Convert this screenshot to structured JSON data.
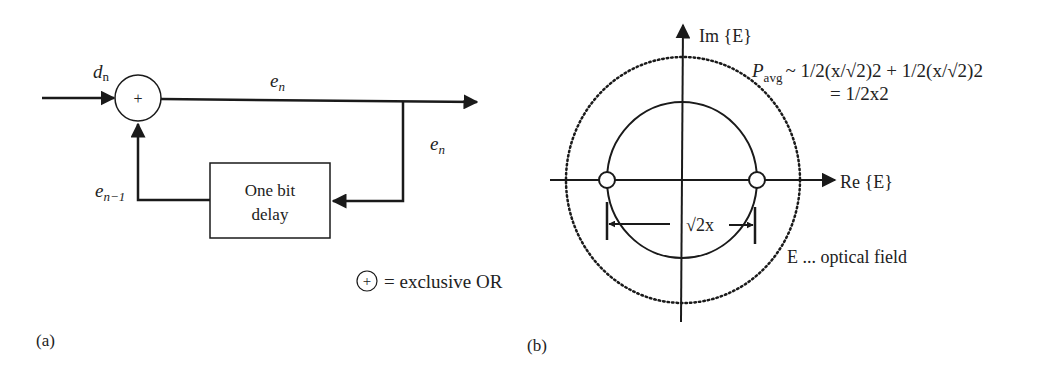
{
  "panel_a": {
    "caption": "(a)",
    "input_label_main": "d",
    "input_label_sub": "n",
    "xor_symbol": "+",
    "output_label_main": "e",
    "output_label_sub": "n",
    "branch_label_main": "e",
    "branch_label_sub": "n",
    "feedback_label_main": "e",
    "feedback_label_sub": "n−1",
    "delay_box_line1": "One bit",
    "delay_box_line2": "delay",
    "legend_symbol": "+",
    "legend_text": "= exclusive OR"
  },
  "panel_b": {
    "caption": "(b)",
    "im_axis_label": "Im {E}",
    "re_axis_label": "Re {E}",
    "pavg_main": "P",
    "pavg_sub": "avg",
    "pavg_formula_line1": "~ 1/2(x/√2)2 + 1/2(x/√2)2",
    "pavg_formula_line2": "= 1/2x2",
    "distance_label": "√2x",
    "field_label": "E ... optical field"
  },
  "colors": {
    "stroke": "#1a1a1a",
    "text": "#222222",
    "background": "#ffffff"
  }
}
